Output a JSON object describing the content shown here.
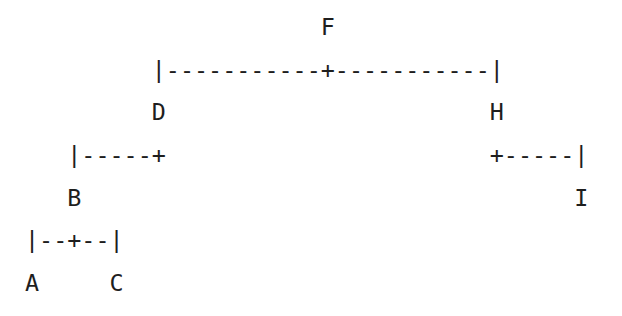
{
  "diagram": {
    "type": "ascii-binary-tree",
    "root": "F",
    "nodes": [
      "A",
      "B",
      "C",
      "D",
      "F",
      "H",
      "I"
    ],
    "edges": [
      {
        "parent": "F",
        "left": "D",
        "right": "H"
      },
      {
        "parent": "D",
        "left": "B",
        "right": null
      },
      {
        "parent": "H",
        "left": null,
        "right": "I"
      },
      {
        "parent": "B",
        "left": "A",
        "right": "C"
      }
    ],
    "lines": [
      "                     F",
      "         |-----------+-----------|",
      "         D                       H",
      "   |-----+                       +-----|",
      "   B                                   I",
      "|--+--|",
      "A     C"
    ]
  }
}
